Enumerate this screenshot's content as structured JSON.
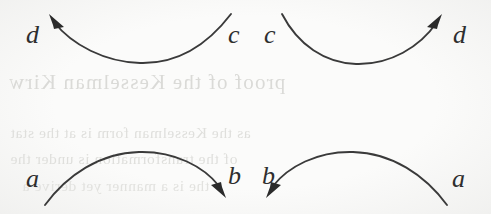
{
  "figure": {
    "kind": "scanned-book-diagram",
    "width": 491,
    "height": 214,
    "background_color": "#fbfbfa",
    "ink_color": "#3a3a3a",
    "arrowhead_color": "#2b2b2b",
    "bleed_text_color": "#d9d9d6"
  },
  "labels": {
    "top_left_arrow_target": "d",
    "top_left_arrow_source": "c",
    "top_right_arrow_source": "c",
    "top_right_arrow_target": "d",
    "bottom_left_arrow_source": "a",
    "bottom_left_arrow_target": "b",
    "bottom_right_arrow_target": "b",
    "bottom_right_arrow_source": "a"
  },
  "arcs": [
    {
      "id": "top-left-arc",
      "from_label": "c",
      "to_label": "d",
      "shape": "valley",
      "direction": "right-to-left",
      "arrow_at": "left-end"
    },
    {
      "id": "top-right-arc",
      "from_label": "c",
      "to_label": "d",
      "shape": "valley",
      "direction": "left-to-right",
      "arrow_at": "right-end"
    },
    {
      "id": "bottom-left-arc",
      "from_label": "a",
      "to_label": "b",
      "shape": "hill",
      "direction": "left-to-right",
      "arrow_at": "right-end"
    },
    {
      "id": "bottom-right-arc",
      "from_label": "a",
      "to_label": "b",
      "shape": "hill",
      "direction": "right-to-left",
      "arrow_at": "left-end"
    }
  ],
  "bleed_through_text": {
    "line_1": "proof of the Kesselman  Kirw",
    "line_2": "as the Kesselman form is at the stat",
    "line_3": "of the transformation is under the",
    "line_4": "the is a manner yet derive a"
  }
}
